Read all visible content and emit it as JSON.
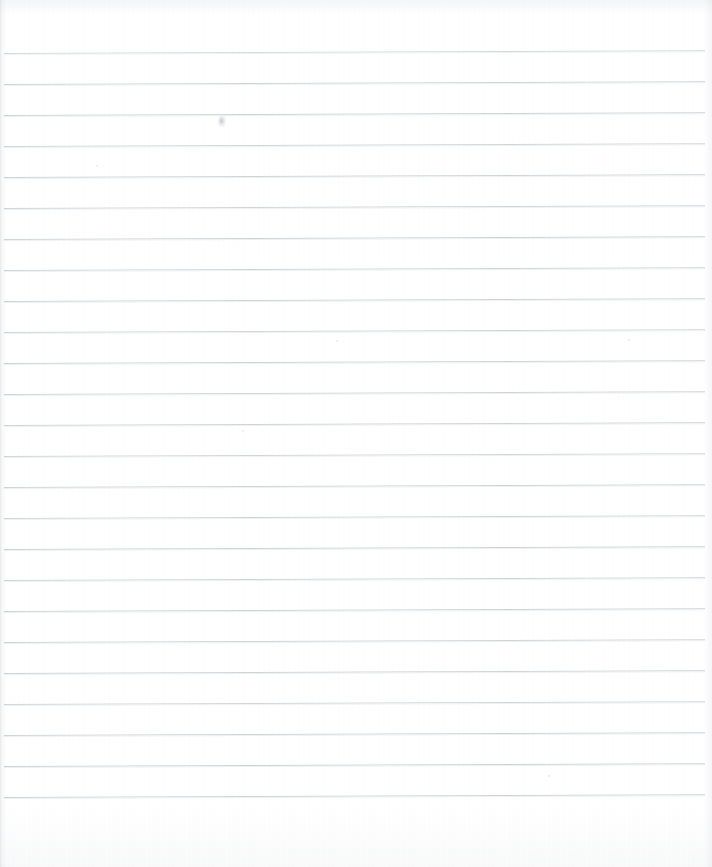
{
  "document": {
    "kind": "scanned-ruled-notebook-page",
    "title": "",
    "visible_text": "",
    "page_width": 712,
    "page_height": 867,
    "background_color": "#ffffff",
    "content_note": "blank — no handwriting or printed text visible"
  },
  "ruling": {
    "line_color": "#c9ced3",
    "line_thickness": 1,
    "line_spacing": 31,
    "first_line_y": 53,
    "last_line_y": 797,
    "line_start_x": 4,
    "line_end_x": 705,
    "skew_degrees": -0.22,
    "line_count": 25,
    "lines": [
      {
        "y": 53,
        "x1": 4,
        "x2": 705,
        "opacity": 0.78
      },
      {
        "y": 84,
        "x1": 4,
        "x2": 705,
        "opacity": 0.88
      },
      {
        "y": 115,
        "x1": 4,
        "x2": 705,
        "opacity": 0.9
      },
      {
        "y": 146,
        "x1": 4,
        "x2": 705,
        "opacity": 0.86
      },
      {
        "y": 177,
        "x1": 4,
        "x2": 705,
        "opacity": 0.9
      },
      {
        "y": 208,
        "x1": 4,
        "x2": 705,
        "opacity": 0.88
      },
      {
        "y": 239,
        "x1": 4,
        "x2": 705,
        "opacity": 0.92
      },
      {
        "y": 270,
        "x1": 4,
        "x2": 705,
        "opacity": 0.88
      },
      {
        "y": 301,
        "x1": 4,
        "x2": 705,
        "opacity": 0.9
      },
      {
        "y": 332,
        "x1": 4,
        "x2": 705,
        "opacity": 0.86
      },
      {
        "y": 363,
        "x1": 4,
        "x2": 705,
        "opacity": 0.9
      },
      {
        "y": 394,
        "x1": 4,
        "x2": 705,
        "opacity": 0.88
      },
      {
        "y": 425,
        "x1": 4,
        "x2": 705,
        "opacity": 0.9
      },
      {
        "y": 456,
        "x1": 4,
        "x2": 705,
        "opacity": 0.86
      },
      {
        "y": 487,
        "x1": 4,
        "x2": 705,
        "opacity": 0.9
      },
      {
        "y": 518,
        "x1": 4,
        "x2": 705,
        "opacity": 0.88
      },
      {
        "y": 549,
        "x1": 4,
        "x2": 705,
        "opacity": 0.92
      },
      {
        "y": 580,
        "x1": 4,
        "x2": 705,
        "opacity": 0.88
      },
      {
        "y": 611,
        "x1": 4,
        "x2": 705,
        "opacity": 0.9
      },
      {
        "y": 642,
        "x1": 4,
        "x2": 705,
        "opacity": 0.88
      },
      {
        "y": 673,
        "x1": 4,
        "x2": 705,
        "opacity": 0.9
      },
      {
        "y": 704,
        "x1": 4,
        "x2": 705,
        "opacity": 0.86
      },
      {
        "y": 735,
        "x1": 4,
        "x2": 705,
        "opacity": 0.9
      },
      {
        "y": 766,
        "x1": 4,
        "x2": 705,
        "opacity": 0.92
      },
      {
        "y": 797,
        "x1": 4,
        "x2": 705,
        "opacity": 0.9
      }
    ]
  },
  "artifacts": {
    "smudges": [
      {
        "x": 218,
        "y": 116,
        "w": 9,
        "h": 11
      }
    ],
    "specks": [
      {
        "x": 96,
        "y": 165,
        "d": 2
      },
      {
        "x": 336,
        "y": 340,
        "d": 2
      },
      {
        "x": 242,
        "y": 430,
        "d": 2
      },
      {
        "x": 548,
        "y": 775,
        "d": 2
      },
      {
        "x": 628,
        "y": 339,
        "d": 2
      }
    ]
  },
  "margins": {
    "top_margin_px": 53,
    "bottom_margin_px": 70,
    "left_margin_px": 4,
    "right_margin_px": 7,
    "vertical_margin_rule": false
  }
}
